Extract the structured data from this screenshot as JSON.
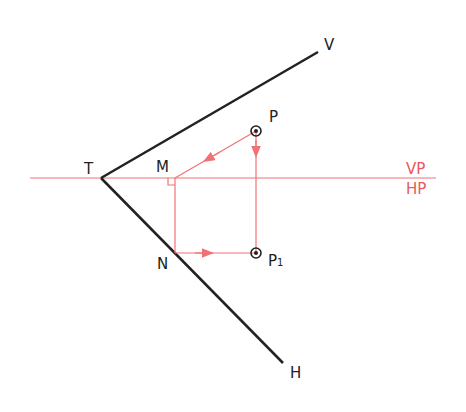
{
  "diagram": {
    "colors": {
      "construction": "#f07275",
      "trace": "#222222",
      "label_red": "#e8585c"
    },
    "points": {
      "T": {
        "label": "T",
        "x": 101,
        "y": 178
      },
      "M": {
        "label": "M",
        "x": 175,
        "y": 178
      },
      "N": {
        "label": "N",
        "x": 175,
        "y": 253
      },
      "P": {
        "label": "P",
        "x": 256,
        "y": 131
      },
      "P1": {
        "label": "P",
        "sub": "1",
        "x": 256,
        "y": 253
      },
      "V": {
        "label": "V",
        "x": 318,
        "y": 52
      },
      "H": {
        "label": "H",
        "x": 283,
        "y": 363
      }
    },
    "reference_line": {
      "top_label": "VP",
      "bottom_label": "HP",
      "y": 178
    }
  }
}
